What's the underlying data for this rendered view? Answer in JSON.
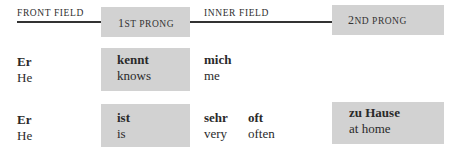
{
  "header": {
    "front_field": "FRONT FIELD",
    "first_prong": {
      "num": "1",
      "suffix": "ST PRONG"
    },
    "inner_field": "INNER FIELD",
    "second_prong": {
      "num": "2",
      "suffix": "ND PRONG"
    }
  },
  "rows": [
    {
      "front": {
        "de": "Er",
        "en": "He"
      },
      "prong1": {
        "de": "kennt",
        "en": "knows"
      },
      "inner": [
        {
          "de": "mich",
          "en": "me"
        }
      ]
    },
    {
      "front": {
        "de": "Er",
        "en": "He"
      },
      "prong1": {
        "de": "ist",
        "en": "is"
      },
      "inner": [
        {
          "de": "sehr",
          "en": "very"
        },
        {
          "de": "oft",
          "en": "often"
        }
      ],
      "prong2": {
        "de": "zu Hause",
        "en": "at home"
      }
    }
  ],
  "colors": {
    "box": "#d2d2d2",
    "rule": "#333333"
  }
}
